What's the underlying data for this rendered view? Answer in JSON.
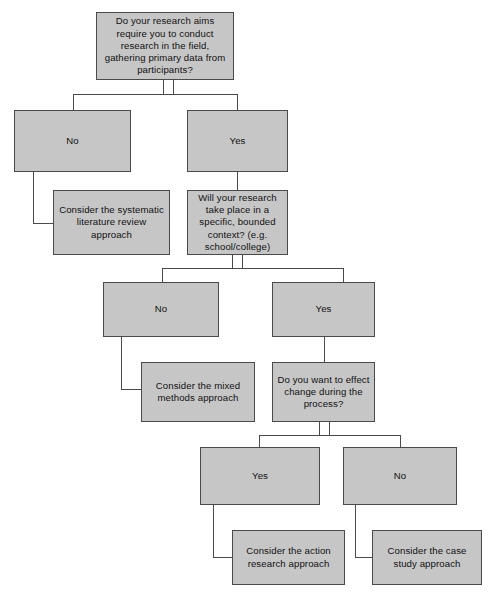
{
  "diagram": {
    "type": "decision-tree-flowchart",
    "colors": {
      "node_fill": "#c6c6c6",
      "node_border": "#4a4a4a",
      "connector": "#4a4a4a",
      "background": "#ffffff",
      "text": "#111111"
    },
    "nodes": [
      {
        "id": "q1",
        "kind": "question",
        "text": "Do your research aims require you to conduct research in the field, gathering primary data from participants?",
        "x": 96,
        "y": 12,
        "w": 138,
        "h": 68
      },
      {
        "id": "q1-no",
        "kind": "answer",
        "text": "No",
        "x": 14,
        "y": 110,
        "w": 117,
        "h": 62
      },
      {
        "id": "q1-yes",
        "kind": "answer",
        "text": "Yes",
        "x": 187,
        "y": 110,
        "w": 101,
        "h": 62
      },
      {
        "id": "out-systematic",
        "kind": "outcome",
        "text": "Consider the systematic literature review approach",
        "x": 53,
        "y": 190,
        "w": 117,
        "h": 65
      },
      {
        "id": "q2",
        "kind": "question",
        "text": "Will your research take place in a specific, bounded context? (e.g. school/college)",
        "x": 187,
        "y": 190,
        "w": 101,
        "h": 65
      },
      {
        "id": "q2-no",
        "kind": "answer",
        "text": "No",
        "x": 103,
        "y": 282,
        "w": 116,
        "h": 55
      },
      {
        "id": "q2-yes",
        "kind": "answer",
        "text": "Yes",
        "x": 272,
        "y": 282,
        "w": 103,
        "h": 55
      },
      {
        "id": "out-mixed",
        "kind": "outcome",
        "text": "Consider the mixed methods approach",
        "x": 141,
        "y": 362,
        "w": 114,
        "h": 60
      },
      {
        "id": "q3",
        "kind": "question",
        "text": "Do you want to effect change during the process?",
        "x": 272,
        "y": 362,
        "w": 103,
        "h": 60
      },
      {
        "id": "q3-yes",
        "kind": "answer",
        "text": "Yes",
        "x": 200,
        "y": 447,
        "w": 120,
        "h": 58
      },
      {
        "id": "q3-no",
        "kind": "answer",
        "text": "No",
        "x": 343,
        "y": 447,
        "w": 114,
        "h": 58
      },
      {
        "id": "out-action",
        "kind": "outcome",
        "text": "Consider the action research approach",
        "x": 232,
        "y": 530,
        "w": 113,
        "h": 55
      },
      {
        "id": "out-case",
        "kind": "outcome",
        "text": "Consider the case study approach",
        "x": 372,
        "y": 530,
        "w": 110,
        "h": 55
      }
    ],
    "connectors": [
      {
        "id": "c1-stub-a",
        "orient": "v",
        "x": 163,
        "y": 80,
        "len": 14
      },
      {
        "id": "c1-stub-b",
        "orient": "v",
        "x": 173,
        "y": 80,
        "len": 14
      },
      {
        "id": "c1-bar",
        "orient": "h",
        "x": 73,
        "y": 94,
        "len": 165
      },
      {
        "id": "c1-left",
        "orient": "v",
        "x": 73,
        "y": 94,
        "len": 16
      },
      {
        "id": "c1-right",
        "orient": "v",
        "x": 237,
        "y": 94,
        "len": 16
      },
      {
        "id": "c2-down",
        "orient": "v",
        "x": 33,
        "y": 172,
        "len": 51
      },
      {
        "id": "c2-right",
        "orient": "h",
        "x": 33,
        "y": 223,
        "len": 21
      },
      {
        "id": "c3-down",
        "orient": "v",
        "x": 237,
        "y": 172,
        "len": 18
      },
      {
        "id": "c4-stub-a",
        "orient": "v",
        "x": 232,
        "y": 255,
        "len": 13
      },
      {
        "id": "c4-stub-b",
        "orient": "v",
        "x": 242,
        "y": 255,
        "len": 13
      },
      {
        "id": "c4-bar",
        "orient": "h",
        "x": 162,
        "y": 268,
        "len": 181
      },
      {
        "id": "c4-left",
        "orient": "v",
        "x": 162,
        "y": 268,
        "len": 15
      },
      {
        "id": "c4-right",
        "orient": "v",
        "x": 343,
        "y": 268,
        "len": 15
      },
      {
        "id": "c5-down",
        "orient": "v",
        "x": 121,
        "y": 337,
        "len": 52
      },
      {
        "id": "c5-right",
        "orient": "h",
        "x": 121,
        "y": 389,
        "len": 21
      },
      {
        "id": "c6-down",
        "orient": "v",
        "x": 324,
        "y": 337,
        "len": 26
      },
      {
        "id": "c7-stub-a",
        "orient": "v",
        "x": 319,
        "y": 422,
        "len": 13
      },
      {
        "id": "c7-stub-b",
        "orient": "v",
        "x": 329,
        "y": 422,
        "len": 13
      },
      {
        "id": "c7-bar",
        "orient": "h",
        "x": 259,
        "y": 435,
        "len": 141
      },
      {
        "id": "c7-left",
        "orient": "v",
        "x": 259,
        "y": 435,
        "len": 13
      },
      {
        "id": "c7-right",
        "orient": "v",
        "x": 400,
        "y": 435,
        "len": 13
      },
      {
        "id": "c8-down",
        "orient": "v",
        "x": 213,
        "y": 505,
        "len": 52
      },
      {
        "id": "c8-right",
        "orient": "h",
        "x": 213,
        "y": 557,
        "len": 20
      },
      {
        "id": "c9-down",
        "orient": "v",
        "x": 355,
        "y": 505,
        "len": 52
      },
      {
        "id": "c9-right",
        "orient": "h",
        "x": 355,
        "y": 557,
        "len": 18
      }
    ]
  }
}
